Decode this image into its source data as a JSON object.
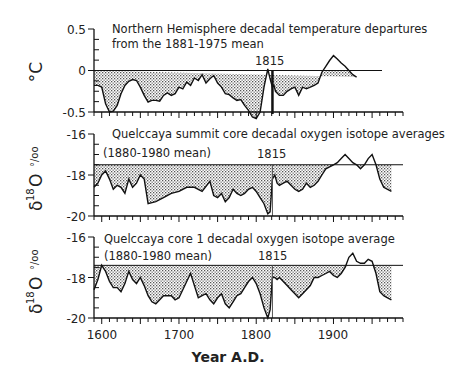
{
  "chart_data": [
    {
      "type": "area",
      "title": "Northern Hemisphere decadal temperature departures from the 1881-1975 mean",
      "title_lines": [
        "Northern Hemisphere decadal temperature departures",
        "from the 1881-1975 mean"
      ],
      "ylabel": "°C",
      "xlabel": "Year A.D.",
      "yticks": [
        "0.5",
        "0",
        "-0.5"
      ],
      "ylim": [
        -0.5,
        0.5
      ],
      "reference": 0,
      "annotation": "1815",
      "x": [
        1590,
        1595,
        1600,
        1605,
        1610,
        1615,
        1620,
        1625,
        1630,
        1635,
        1640,
        1645,
        1650,
        1655,
        1660,
        1665,
        1670,
        1675,
        1680,
        1685,
        1690,
        1695,
        1700,
        1705,
        1710,
        1715,
        1720,
        1725,
        1730,
        1735,
        1740,
        1745,
        1750,
        1755,
        1760,
        1765,
        1770,
        1775,
        1780,
        1785,
        1790,
        1795,
        1800,
        1805,
        1810,
        1815,
        1818,
        1821,
        1823,
        1825,
        1830,
        1835,
        1840,
        1845,
        1850,
        1855,
        1860,
        1865,
        1870,
        1875,
        1880,
        1885,
        1890,
        1895,
        1900,
        1905,
        1910,
        1915,
        1920,
        1925,
        1930,
        1935,
        1940,
        1945,
        1950,
        1955,
        1960,
        1965,
        1970
      ],
      "values": [
        -0.18,
        -0.18,
        -0.2,
        -0.4,
        -0.5,
        -0.49,
        -0.42,
        -0.28,
        -0.18,
        -0.13,
        -0.11,
        -0.12,
        -0.2,
        -0.3,
        -0.38,
        -0.36,
        -0.36,
        -0.37,
        -0.3,
        -0.27,
        -0.3,
        -0.28,
        -0.2,
        -0.22,
        -0.14,
        -0.18,
        -0.09,
        -0.12,
        -0.05,
        -0.15,
        -0.1,
        -0.06,
        -0.15,
        -0.2,
        -0.28,
        -0.29,
        -0.33,
        -0.36,
        -0.35,
        -0.42,
        -0.48,
        -0.56,
        -0.58,
        -0.5,
        -0.2,
        0.02,
        -0.1,
        -0.2,
        -0.18,
        -0.25,
        -0.3,
        -0.3,
        -0.25,
        -0.22,
        -0.2,
        -0.3,
        -0.2,
        -0.22,
        -0.2,
        -0.18,
        -0.15,
        -0.02,
        0.05,
        0.12,
        0.18,
        0.14,
        0.09,
        0.05,
        0.0,
        -0.05,
        -0.08
      ],
      "xlim": [
        1590,
        1990
      ]
    },
    {
      "type": "area",
      "title": "Quelccaya summit core decadal oxygen isotope averages",
      "subtitle": "(1880-1980 mean)",
      "ylabel": "δ18O ‰",
      "yticks": [
        "-16",
        "-18",
        "-20"
      ],
      "ylim": [
        -20,
        -16
      ],
      "reference": -17.5,
      "annotation": "1815",
      "x": [
        1590,
        1595,
        1600,
        1605,
        1610,
        1615,
        1620,
        1625,
        1630,
        1635,
        1640,
        1645,
        1650,
        1655,
        1660,
        1670,
        1680,
        1690,
        1700,
        1710,
        1720,
        1730,
        1740,
        1745,
        1750,
        1755,
        1760,
        1765,
        1770,
        1775,
        1780,
        1785,
        1790,
        1795,
        1800,
        1805,
        1810,
        1815,
        1818,
        1821,
        1824,
        1827,
        1830,
        1835,
        1840,
        1845,
        1850,
        1855,
        1860,
        1865,
        1870,
        1875,
        1880,
        1885,
        1890,
        1895,
        1900,
        1905,
        1910,
        1915,
        1920,
        1925,
        1930,
        1935,
        1940,
        1945,
        1950,
        1955,
        1960,
        1965,
        1970,
        1975
      ],
      "values": [
        -18.6,
        -18.4,
        -18.0,
        -17.8,
        -18.2,
        -18.7,
        -18.5,
        -18.6,
        -18.9,
        -18.2,
        -18.6,
        -18.4,
        -18.0,
        -18.2,
        -19.4,
        -19.3,
        -19.1,
        -18.9,
        -18.8,
        -18.6,
        -18.6,
        -18.8,
        -18.3,
        -19.0,
        -19.1,
        -18.9,
        -19.3,
        -19.1,
        -18.7,
        -18.9,
        -19.0,
        -18.9,
        -18.7,
        -18.6,
        -18.8,
        -19.1,
        -19.4,
        -19.9,
        -19.8,
        -18.2,
        -18.0,
        -18.4,
        -18.5,
        -18.4,
        -18.3,
        -18.5,
        -18.7,
        -18.8,
        -18.7,
        -18.4,
        -18.6,
        -18.5,
        -18.3,
        -18.0,
        -17.7,
        -17.6,
        -17.5,
        -17.4,
        -17.2,
        -17.0,
        -17.2,
        -17.4,
        -17.5,
        -17.7,
        -17.5,
        -17.2,
        -17.0,
        -17.5,
        -18.2,
        -18.6,
        -18.7,
        -18.8
      ],
      "xlim": [
        1590,
        1990
      ]
    },
    {
      "type": "area",
      "title": "Quelccaya core 1 decadal oxygen isotope average",
      "subtitle": "(1880-1980 mean)",
      "ylabel": "δ18O ‰",
      "yticks": [
        "-16",
        "-18",
        "-20"
      ],
      "ylim": [
        -20,
        -16
      ],
      "reference": -17.4,
      "annotation": "1815",
      "xticks": [
        "1600",
        "1700",
        "1800",
        "1900"
      ],
      "x": [
        1590,
        1595,
        1600,
        1605,
        1610,
        1615,
        1620,
        1625,
        1630,
        1635,
        1640,
        1645,
        1650,
        1655,
        1660,
        1665,
        1670,
        1675,
        1680,
        1685,
        1690,
        1695,
        1700,
        1705,
        1710,
        1715,
        1720,
        1725,
        1730,
        1735,
        1740,
        1745,
        1750,
        1755,
        1760,
        1765,
        1770,
        1775,
        1780,
        1785,
        1790,
        1795,
        1800,
        1805,
        1810,
        1815,
        1818,
        1821,
        1824,
        1827,
        1830,
        1835,
        1840,
        1845,
        1850,
        1855,
        1860,
        1865,
        1870,
        1875,
        1880,
        1885,
        1890,
        1895,
        1900,
        1905,
        1910,
        1915,
        1920,
        1925,
        1930,
        1935,
        1940,
        1945,
        1950,
        1955,
        1960,
        1965,
        1970,
        1975
      ],
      "values": [
        -18.6,
        -18.1,
        -17.4,
        -17.7,
        -18.2,
        -18.5,
        -18.5,
        -18.7,
        -18.3,
        -17.7,
        -18.1,
        -18.3,
        -18.0,
        -18.4,
        -18.9,
        -19.2,
        -19.3,
        -19.1,
        -18.9,
        -18.9,
        -18.9,
        -19.1,
        -19.0,
        -18.6,
        -18.2,
        -17.8,
        -18.4,
        -19.0,
        -18.9,
        -18.8,
        -19.1,
        -19.3,
        -19.0,
        -18.8,
        -19.3,
        -19.5,
        -19.2,
        -18.9,
        -18.8,
        -18.5,
        -18.2,
        -18.0,
        -18.3,
        -18.8,
        -19.5,
        -20.0,
        -19.6,
        -18.0,
        -18.0,
        -18.1,
        -18.0,
        -18.2,
        -18.4,
        -18.6,
        -18.8,
        -19.0,
        -18.8,
        -18.6,
        -18.4,
        -18.0,
        -18.0,
        -17.9,
        -17.8,
        -17.7,
        -17.9,
        -18.0,
        -17.8,
        -17.5,
        -17.0,
        -16.8,
        -17.2,
        -17.3,
        -17.3,
        -17.1,
        -17.2,
        -17.8,
        -18.7,
        -18.9,
        -19.0,
        -19.1
      ],
      "xlim": [
        1590,
        1990
      ]
    }
  ],
  "labels": {
    "panel1_title_line1": "Northern Hemisphere decadal temperature departures",
    "panel1_title_line2": "from the 1881-1975 mean",
    "panel1_ylabel": "°C",
    "panel1_yticks": [
      "0.5",
      "0",
      "-0.5"
    ],
    "panel2_title": "Quelccaya summit core decadal oxygen isotope averages",
    "panel2_subtitle": "(1880-1980 mean)",
    "panel2_yticks": [
      "-16",
      "-18",
      "-20"
    ],
    "panel3_title": "Quelccaya core 1 decadal oxygen isotope average",
    "panel3_subtitle": "(1880-1980 mean)",
    "panel3_yticks": [
      "-16",
      "-18",
      "-20"
    ],
    "isotope_ylabel_delta": "δ",
    "isotope_ylabel_sup": "18",
    "isotope_ylabel_o": "O",
    "isotope_ylabel_permil": "°/oo",
    "annotation": "1815",
    "xticks": [
      "1600",
      "1700",
      "1800",
      "1900"
    ],
    "xlabel": "Year A.D."
  }
}
